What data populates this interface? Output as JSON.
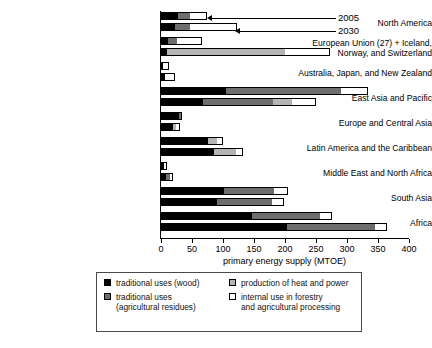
{
  "chart_data": {
    "type": "bar",
    "orientation": "horizontal",
    "title": "",
    "xlabel": "primary energy supply (MTOE)",
    "ylabel": "",
    "xlim": [
      0,
      400
    ],
    "xticks": [
      0,
      50,
      100,
      150,
      200,
      250,
      300,
      350,
      400
    ],
    "grid": false,
    "stacked": true,
    "legend_position": "bottom",
    "series": [
      {
        "name": "traditional uses (wood)",
        "key": "wood",
        "color": "#000000"
      },
      {
        "name": "traditional uses (agricultural residues)",
        "key": "agri",
        "color": "#6e6e6e"
      },
      {
        "name": "production of heat and power",
        "key": "heat",
        "color": "#b4b4b4"
      },
      {
        "name": "internal use in forestry and agricultural processing",
        "key": "internal",
        "color": "#ffffff"
      }
    ],
    "year_labels": [
      "2005",
      "2030"
    ],
    "categories": [
      "North America",
      "European Union (27) + Iceland, Norway, and Switzerland",
      "Australia, Japan, and New Zealand",
      "East Asia and Pacific",
      "Europe and Central Asia",
      "Latin America and the Caribbean",
      "Middle East and North Africa",
      "South Asia",
      "Africa"
    ],
    "rows": [
      {
        "category": "North America",
        "label_lines": [
          "North America"
        ],
        "bars": [
          {
            "year": "2005",
            "wood": 28,
            "agri": 18,
            "heat": 0,
            "internal": 29
          },
          {
            "year": "2030",
            "wood": 23,
            "agri": 23,
            "heat": 0,
            "internal": 76
          }
        ]
      },
      {
        "category": "European Union (27) + Iceland, Norway, and Switzerland",
        "label_lines": [
          "European Union (27) + Iceland,",
          "Norway, and Switzerland"
        ],
        "bars": [
          {
            "year": "2005",
            "wood": 11,
            "agri": 15,
            "heat": 0,
            "internal": 40
          },
          {
            "year": "2030",
            "wood": 10,
            "agri": 0,
            "heat": 190,
            "internal": 72
          }
        ]
      },
      {
        "category": "Australia, Japan, and New Zealand",
        "label_lines": [
          "Australia, Japan, and New Zealand"
        ],
        "bars": [
          {
            "year": "2005",
            "wood": 4,
            "agri": 0,
            "heat": 0,
            "internal": 9
          },
          {
            "year": "2030",
            "wood": 7,
            "agri": 0,
            "heat": 0,
            "internal": 15
          }
        ]
      },
      {
        "category": "East Asia and Pacific",
        "label_lines": [
          "East Asia and Pacific"
        ],
        "bars": [
          {
            "year": "2005",
            "wood": 105,
            "agri": 185,
            "heat": 0,
            "internal": 44
          },
          {
            "year": "2030",
            "wood": 67,
            "agri": 113,
            "heat": 32,
            "internal": 38
          }
        ]
      },
      {
        "category": "Europe and Central Asia",
        "label_lines": [
          "Europe and Central Asia"
        ],
        "bars": [
          {
            "year": "2005",
            "wood": 29,
            "agri": 5,
            "heat": 0,
            "internal": 0
          },
          {
            "year": "2030",
            "wood": 19,
            "agri": 0,
            "heat": 5,
            "internal": 7
          }
        ]
      },
      {
        "category": "Latin America and the Caribbean",
        "label_lines": [
          "Latin America and the Caribbean"
        ],
        "bars": [
          {
            "year": "2005",
            "wood": 76,
            "agri": 0,
            "heat": 14,
            "internal": 10
          },
          {
            "year": "2030",
            "wood": 85,
            "agri": 0,
            "heat": 36,
            "internal": 11
          }
        ]
      },
      {
        "category": "Middle East and North Africa",
        "label_lines": [
          "Middle East and North Africa"
        ],
        "bars": [
          {
            "year": "2005",
            "wood": 5,
            "agri": 0,
            "heat": 0,
            "internal": 4
          },
          {
            "year": "2030",
            "wood": 8,
            "agri": 6,
            "heat": 0,
            "internal": 5
          }
        ]
      },
      {
        "category": "South Asia",
        "label_lines": [
          "South Asia"
        ],
        "bars": [
          {
            "year": "2005",
            "wood": 102,
            "agri": 80,
            "heat": 0,
            "internal": 23
          },
          {
            "year": "2030",
            "wood": 90,
            "agri": 89,
            "heat": 0,
            "internal": 19
          }
        ]
      },
      {
        "category": "Africa",
        "label_lines": [
          "Africa"
        ],
        "bars": [
          {
            "year": "2005",
            "wood": 147,
            "agri": 109,
            "heat": 0,
            "internal": 20
          },
          {
            "year": "2030",
            "wood": 203,
            "agri": 142,
            "heat": 0,
            "internal": 19
          }
        ]
      }
    ]
  },
  "axis": {
    "x_title": "primary energy supply (MTOE)",
    "tick_labels": [
      "0",
      "50",
      "100",
      "150",
      "200",
      "250",
      "300",
      "350",
      "400"
    ]
  },
  "callouts": [
    {
      "label": "2005"
    },
    {
      "label": "2030"
    }
  ],
  "legend": {
    "items": [
      {
        "label_line1": "traditional uses (wood)",
        "label_line2": "",
        "swatch": "#000000"
      },
      {
        "label_line1": "traditional uses",
        "label_line2": "(agricultural residues)",
        "swatch": "#6e6e6e"
      },
      {
        "label_line1": "production of heat and power",
        "label_line2": "",
        "swatch": "#b4b4b4"
      },
      {
        "label_line1": "internal use in forestry",
        "label_line2": "and agricultural processing",
        "swatch": "#ffffff"
      }
    ]
  }
}
